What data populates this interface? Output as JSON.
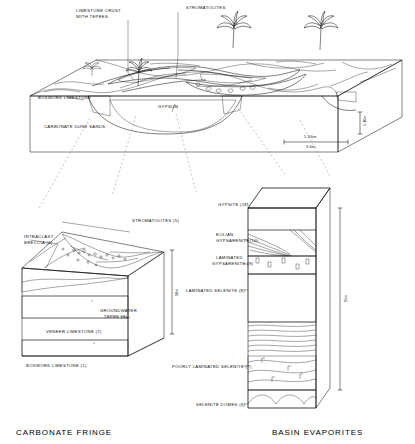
{
  "figure": {
    "title_top_left": "LIMESTONE CRUST WITH TEPEES"
  },
  "top_block": {
    "name": "regional-block-diagram",
    "labels": [
      {
        "id": "limestone-crust",
        "text_line1": "LIMESTONE CRUST",
        "text_line2": "WITH TEPEES"
      },
      {
        "id": "stromatolites",
        "text_line1": "STROMATOLITES",
        "text_line2": ""
      },
      {
        "id": "boxwork-limestone",
        "text_line1": "BOXWORK LIMESTONE",
        "text_line2": ""
      },
      {
        "id": "gypsum",
        "text_line1": "GYPSUM",
        "text_line2": ""
      },
      {
        "id": "carbonate-dune-sands",
        "text_line1": "CARBONATE DUNE SANDS",
        "text_line2": ""
      }
    ],
    "scale": {
      "horizontal_line1": "5-10km",
      "horizontal_line2": "3-6mi.",
      "vertical": "5-10m"
    }
  },
  "left_block": {
    "name": "carbonate-fringe-block",
    "caption": "CARBONATE FRINGE",
    "scale": "10m",
    "labels": [
      {
        "n": "5",
        "text_line1": "STROMATOLITES (5)",
        "text_line2": ""
      },
      {
        "n": "4",
        "text_line1": "INTRACLAST",
        "text_line2": "BRECCIA (4)"
      },
      {
        "n": "3",
        "text_line1": "GROUNDWATER",
        "text_line2": "TEPEE (3)"
      },
      {
        "n": "2",
        "text_line1": "VENEER LIMESTONE (2)",
        "text_line2": ""
      },
      {
        "n": "1",
        "text_line1": "BOXWORK LIMESTONE (1)",
        "text_line2": ""
      }
    ]
  },
  "right_column": {
    "name": "basin-evaporites-column",
    "caption": "BASIN EVAPORITES",
    "scale": "15m",
    "labels": [
      {
        "n": "11",
        "text_line1": "GYPSITE (11)",
        "text_line2": ""
      },
      {
        "n": "10",
        "text_line1": "EOLIAN",
        "text_line2": "GYPSARENITE(10)"
      },
      {
        "n": "9",
        "text_line1": "LAMINATED",
        "text_line2": "GYPSARENITE (9)"
      },
      {
        "n": "8",
        "text_line1": "LAMINATED SELENITE (8)",
        "text_line2": ""
      },
      {
        "n": "7",
        "text_line1": "POORLY LAMINATED SELENITE (7)",
        "text_line2": ""
      },
      {
        "n": "6",
        "text_line1": "SELENITE DOMES (6)",
        "text_line2": ""
      }
    ]
  },
  "colors": {
    "ink": "#000000",
    "sand": "#f3f3f3",
    "guide": "#777777"
  }
}
